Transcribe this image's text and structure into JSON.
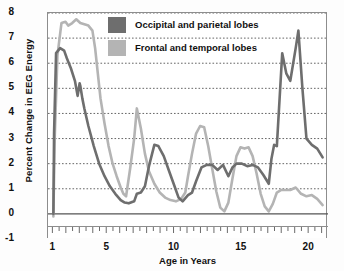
{
  "chart_data": {
    "type": "line",
    "title": "",
    "xlabel": "Age in Years",
    "ylabel": "Percent Change in EEG Energy",
    "xlim": [
      0.6,
      21.4
    ],
    "ylim": [
      -1,
      8
    ],
    "xticks": [
      1,
      5,
      10,
      15,
      20
    ],
    "yticks": [
      -1,
      0,
      1,
      2,
      3,
      4,
      5,
      6,
      7,
      8
    ],
    "grid": "horizontal-dotted",
    "minor_xticks_interval": 0.5,
    "legend_position": "top-center",
    "colors": {
      "occipital_parietal": "#6e6e6e",
      "frontal_temporal": "#b4b4b4",
      "gridline": "#555555",
      "axis": "#8d8d8d"
    },
    "series": [
      {
        "name": "Occipital and parietal lobes",
        "color": "#6e6e6e",
        "x": [
          1.0,
          1.05,
          1.2,
          1.5,
          1.8,
          2.0,
          2.3,
          2.6,
          2.8,
          2.95,
          3.0,
          3.15,
          3.3,
          3.6,
          4.0,
          4.4,
          4.8,
          5.2,
          5.6,
          6.0,
          6.3,
          6.6,
          7.0,
          7.2,
          7.5,
          7.8,
          8.1,
          8.5,
          8.8,
          9.2,
          9.6,
          10.0,
          10.3,
          10.6,
          11.0,
          11.3,
          11.6,
          12.0,
          12.4,
          12.8,
          13.2,
          13.6,
          14.0,
          14.3,
          14.6,
          15.0,
          15.4,
          15.8,
          16.2,
          16.6,
          17.0,
          17.2,
          17.4,
          17.6,
          18.0,
          18.3,
          18.6,
          19.0,
          19.2,
          19.5,
          19.8,
          20.2,
          20.6,
          21.0
        ],
        "y": [
          0.0,
          3.2,
          6.4,
          6.6,
          6.5,
          6.2,
          5.8,
          5.3,
          4.7,
          5.2,
          5.1,
          4.6,
          4.2,
          3.5,
          2.7,
          2.0,
          1.5,
          1.1,
          0.8,
          0.55,
          0.45,
          0.42,
          0.5,
          0.8,
          0.85,
          1.1,
          1.9,
          2.75,
          2.7,
          2.3,
          1.7,
          1.1,
          0.65,
          0.5,
          0.75,
          0.85,
          1.3,
          1.85,
          1.95,
          1.95,
          1.75,
          1.95,
          1.5,
          1.85,
          2.0,
          2.0,
          1.9,
          1.95,
          1.85,
          1.55,
          1.2,
          2.2,
          2.75,
          2.7,
          6.4,
          5.6,
          5.3,
          6.6,
          7.3,
          5.0,
          3.0,
          2.75,
          2.6,
          2.25
        ]
      },
      {
        "name": "Frontal and temporal lobes",
        "color": "#b4b4b4",
        "x": [
          1.0,
          1.1,
          1.3,
          1.6,
          1.9,
          2.1,
          2.4,
          2.7,
          3.0,
          3.3,
          3.6,
          3.9,
          4.1,
          4.3,
          4.5,
          4.8,
          5.1,
          5.4,
          5.7,
          6.0,
          6.2,
          6.4,
          6.7,
          7.0,
          7.2,
          7.5,
          7.8,
          8.1,
          8.5,
          8.9,
          9.3,
          9.7,
          10.1,
          10.5,
          10.8,
          11.0,
          11.3,
          11.6,
          11.9,
          12.2,
          12.5,
          12.8,
          13.1,
          13.4,
          13.7,
          14.0,
          14.3,
          14.6,
          14.9,
          15.2,
          15.5,
          15.8,
          16.1,
          16.4,
          16.7,
          17.0,
          17.3,
          17.6,
          17.9,
          18.2,
          18.6,
          19.0,
          19.4,
          19.8,
          20.2,
          20.6,
          21.0
        ],
        "y": [
          -0.1,
          3.0,
          6.3,
          7.6,
          7.65,
          7.5,
          7.6,
          7.75,
          7.6,
          7.55,
          7.5,
          7.3,
          6.6,
          5.6,
          4.6,
          3.6,
          2.7,
          2.0,
          1.5,
          1.05,
          0.8,
          0.7,
          1.8,
          3.0,
          4.2,
          3.4,
          2.4,
          1.7,
          1.2,
          0.85,
          0.65,
          0.55,
          0.5,
          0.6,
          0.85,
          1.5,
          2.4,
          3.2,
          3.5,
          3.45,
          2.7,
          1.8,
          0.9,
          0.25,
          0.1,
          0.45,
          1.4,
          2.3,
          2.65,
          2.6,
          2.65,
          2.3,
          1.6,
          0.8,
          0.3,
          0.1,
          0.4,
          0.85,
          0.95,
          0.95,
          0.95,
          1.05,
          0.8,
          0.7,
          0.75,
          0.6,
          0.35
        ]
      }
    ]
  },
  "legend": {
    "items": [
      {
        "label": "Occipital and parietal lobes",
        "color": "#6e6e6e"
      },
      {
        "label": "Frontal and temporal lobes",
        "color": "#b4b4b4"
      }
    ]
  },
  "axes": {
    "y_title": "Percent Change in EEG Energy",
    "x_title": "Age in Years",
    "y_labels": [
      "8",
      "7",
      "6",
      "5",
      "4",
      "3",
      "2",
      "1",
      "0",
      "-1"
    ],
    "x_labels": [
      "1",
      "5",
      "10",
      "15",
      "20"
    ]
  }
}
